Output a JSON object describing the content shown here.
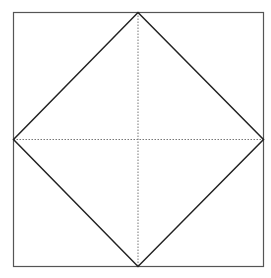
{
  "diagram": {
    "colors": {
      "background": "#ffffff",
      "square_stroke": "#555555",
      "diamond_stroke": "#222222",
      "dotted_stroke": "#777777"
    },
    "square": {
      "x1": 13.5,
      "y1": 12.5,
      "x2": 263.5,
      "y2": 266.5
    },
    "diamond": {
      "top": [
        138,
        12.5
      ],
      "right": [
        263.5,
        139.5
      ],
      "bottom": [
        138,
        266.5
      ],
      "left": [
        13.5,
        139.5
      ]
    },
    "dotted_lines": {
      "vertical": {
        "x": 138,
        "y1": 12.5,
        "y2": 266.5
      },
      "horizontal": {
        "y": 139.5,
        "x1": 13.5,
        "x2": 263.5
      }
    }
  }
}
